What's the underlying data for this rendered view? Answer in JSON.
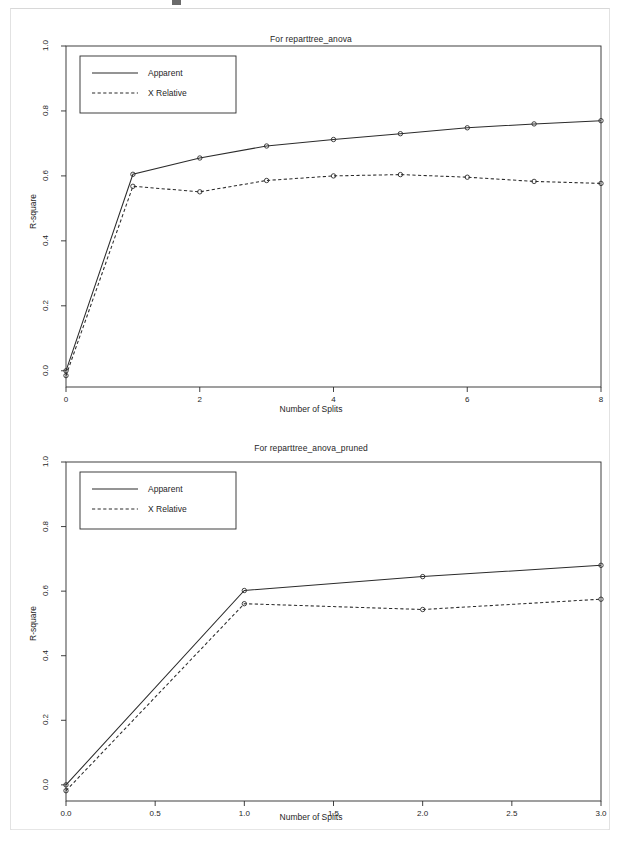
{
  "page": {
    "background": "#ffffff",
    "ink_color": "#1a1a1a",
    "scan_border_color": "#e2e2e2"
  },
  "chart_data": [
    {
      "type": "line",
      "title": "For reparttree_anova",
      "xlabel": "Number of Splits",
      "ylabel": "R-square",
      "x": [
        0,
        1,
        2,
        3,
        4,
        5,
        6,
        7,
        8
      ],
      "xlim": [
        0,
        8
      ],
      "ylim": [
        0.0,
        1.0
      ],
      "xticks": [
        "0",
        "2",
        "4",
        "6",
        "8"
      ],
      "xtick_values": [
        0,
        2,
        4,
        6,
        8
      ],
      "yticks": [
        "0.0",
        "0.2",
        "0.4",
        "0.6",
        "0.8",
        "1.0"
      ],
      "ytick_values": [
        0.0,
        0.2,
        0.4,
        0.6,
        0.8,
        1.0
      ],
      "grid": false,
      "legend_position": "top-left",
      "series": [
        {
          "name": "Apparent",
          "style": "solid",
          "marker": "circle",
          "values": [
            0.0,
            0.605,
            0.655,
            0.692,
            0.712,
            0.73,
            0.748,
            0.76,
            0.77
          ]
        },
        {
          "name": "X Relative",
          "style": "dashed",
          "marker": "circle",
          "values": [
            -0.015,
            0.568,
            0.551,
            0.586,
            0.6,
            0.604,
            0.596,
            0.583,
            0.577
          ]
        }
      ]
    },
    {
      "type": "line",
      "title": "For reparttree_anova_pruned",
      "xlabel": "Number of Splits",
      "ylabel": "R-square",
      "x": [
        0,
        1,
        2,
        3
      ],
      "xlim": [
        0,
        3
      ],
      "ylim": [
        0.0,
        1.0
      ],
      "xticks": [
        "0.0",
        "0.5",
        "1.0",
        "1.5",
        "2.0",
        "2.5",
        "3.0"
      ],
      "xtick_values": [
        0.0,
        0.5,
        1.0,
        1.5,
        2.0,
        2.5,
        3.0
      ],
      "yticks": [
        "0.0",
        "0.2",
        "0.4",
        "0.6",
        "0.8",
        "1.0"
      ],
      "ytick_values": [
        0.0,
        0.2,
        0.4,
        0.6,
        0.8,
        1.0
      ],
      "grid": false,
      "legend_position": "top-left",
      "series": [
        {
          "name": "Apparent",
          "style": "solid",
          "marker": "circle",
          "values": [
            0.0,
            0.602,
            0.645,
            0.68
          ]
        },
        {
          "name": "X Relative",
          "style": "dashed",
          "marker": "circle",
          "values": [
            -0.018,
            0.561,
            0.543,
            0.575
          ]
        }
      ]
    }
  ]
}
